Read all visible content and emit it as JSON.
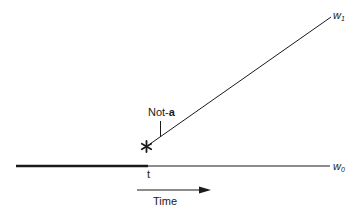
{
  "diagram": {
    "labels": {
      "w1": {
        "base": "w",
        "sub": "1"
      },
      "w0": {
        "base": "w",
        "sub": "0"
      },
      "annotation_prefix": "Not-",
      "annotation_bold": "a",
      "time_point": "t",
      "time_axis": "Time",
      "branch_marker": "*"
    },
    "colors": {
      "line": "#1a1a1a",
      "background": "#ffffff"
    }
  }
}
